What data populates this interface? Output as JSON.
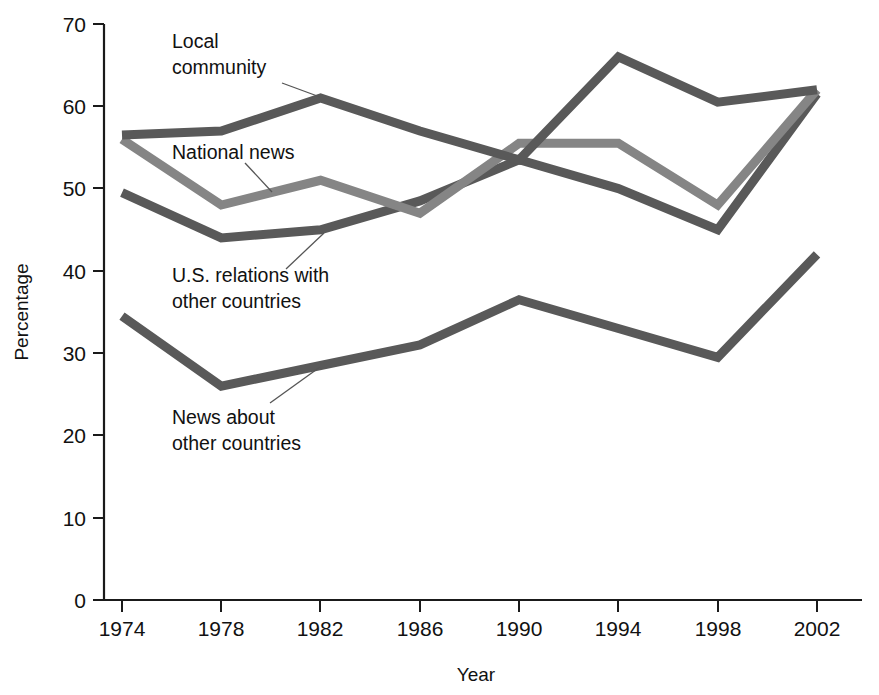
{
  "chart_data": {
    "type": "line",
    "title": "",
    "xlabel": "Year",
    "ylabel": "Percentage",
    "categories": [
      "1974",
      "1978",
      "1982",
      "1986",
      "1990",
      "1994",
      "1998",
      "2002"
    ],
    "x": [
      1974,
      1978,
      1982,
      1986,
      1990,
      1994,
      1998,
      2002
    ],
    "xlim": [
      1974,
      2002
    ],
    "ylim": [
      0,
      70
    ],
    "yticks": [
      0,
      10,
      20,
      30,
      40,
      50,
      60,
      70
    ],
    "ytick_labels": [
      "0",
      "10",
      "20",
      "30",
      "40",
      "50",
      "60",
      "70"
    ],
    "grid": false,
    "legend": "inline-annotations",
    "series": [
      {
        "name": "Local community",
        "color": "#595959",
        "values": [
          56.5,
          57,
          61,
          57,
          53.5,
          66,
          60.5,
          62
        ]
      },
      {
        "name": "National news",
        "color": "#858585",
        "values": [
          56,
          48,
          51,
          47,
          55.5,
          55.5,
          48,
          62
        ]
      },
      {
        "name": "U.S. relations with other countries",
        "color": "#595959",
        "values": [
          49.5,
          44,
          45,
          48.5,
          53.5,
          50,
          45,
          61.5
        ]
      },
      {
        "name": "News about other countries",
        "color": "#595959",
        "values": [
          34.5,
          26,
          28.5,
          31,
          36.5,
          33,
          29.5,
          42
        ]
      }
    ],
    "annotations": [
      {
        "text_lines": [
          "Local",
          "community"
        ],
        "series": "Local community"
      },
      {
        "text_lines": [
          "National news"
        ],
        "series": "National news"
      },
      {
        "text_lines": [
          "U.S. relations with",
          "other countries"
        ],
        "series": "U.S. relations with other countries"
      },
      {
        "text_lines": [
          "News about",
          "other countries"
        ],
        "series": "News about other countries"
      }
    ]
  },
  "axes": {
    "y_title": "Percentage",
    "x_title": "Year",
    "y_ticks": [
      "70",
      "60",
      "50",
      "40",
      "30",
      "20",
      "10",
      "0"
    ],
    "x_ticks": [
      "1974",
      "1978",
      "1982",
      "1986",
      "1990",
      "1994",
      "1998",
      "2002"
    ]
  },
  "labels": {
    "local_community_l1": "Local",
    "local_community_l2": "community",
    "national_news_l1": "National news",
    "us_relations_l1": "U.S. relations with",
    "us_relations_l2": "other countries",
    "news_other_l1": "News about",
    "news_other_l2": "other countries"
  },
  "colors": {
    "dark_line": "#595959",
    "light_line": "#858585",
    "axis": "#1a1a1a",
    "background": "#ffffff"
  }
}
